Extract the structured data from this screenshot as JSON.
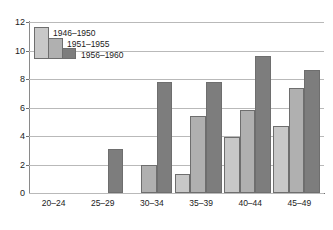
{
  "chart_data": {
    "type": "bar",
    "title": "",
    "subtitle": "",
    "xlabel": "",
    "ylabel": "",
    "categories": [
      "20–24",
      "25–29",
      "30–34",
      "35–39",
      "40–44",
      "45–49"
    ],
    "series": [
      {
        "name": "1946–1950",
        "color": "#c8c8c8",
        "values": [
          null,
          null,
          null,
          1.3,
          3.9,
          4.7
        ]
      },
      {
        "name": "1951–1955",
        "color": "#b0b0b0",
        "values": [
          null,
          null,
          2.0,
          5.4,
          5.8,
          7.4
        ]
      },
      {
        "name": "1956–1960",
        "color": "#7d7d7d",
        "values": [
          null,
          3.1,
          7.8,
          7.8,
          9.65,
          8.6
        ]
      }
    ],
    "ylim": [
      0,
      12
    ],
    "yticks": [
      0,
      2,
      4,
      6,
      8,
      10,
      12
    ],
    "ytick_labels": [
      "0",
      "2",
      "4",
      "6",
      "8",
      "10",
      "12"
    ],
    "grid": true,
    "grid_axis": "y",
    "legend_position": "upper-left",
    "bar_border_color": "#6e6e6e",
    "axis_color": "#6f6f6f",
    "gridline_color": "#b9b9b9",
    "text_color": "#1b1b1b"
  },
  "legend": {
    "entries": [
      {
        "label": "1946–1950"
      },
      {
        "label": "1951–1955"
      },
      {
        "label": "1956–1960"
      }
    ]
  },
  "axes": {
    "y": {
      "labels": [
        "12",
        "10",
        "8",
        "6",
        "4",
        "2",
        "0"
      ]
    },
    "x": {
      "labels": [
        "20–24",
        "25–29",
        "30–34",
        "35–39",
        "40–44",
        "45–49"
      ]
    }
  }
}
